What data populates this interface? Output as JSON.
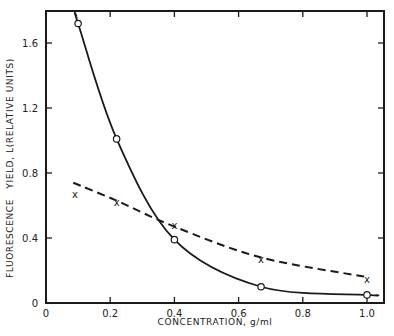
{
  "chart_data": {
    "type": "line",
    "title": "",
    "xlabel": "CONCENTRATION, g/ml",
    "ylabel": "FLUORESCENCE   YIELD, L(RELATIVE UNITS)",
    "xlim": [
      0,
      1.0
    ],
    "ylim": [
      0,
      1.8
    ],
    "x_ticks": [
      0,
      0.2,
      0.4,
      0.6,
      0.8,
      1.0
    ],
    "x_tick_labels": [
      "0",
      "0.2",
      "0.4",
      "0.6",
      "0.8",
      "1.0"
    ],
    "y_ticks": [
      0,
      0.4,
      0.8,
      1.2,
      1.6
    ],
    "y_tick_labels": [
      "0",
      "0.4",
      "0.8",
      "1.2",
      "1.6"
    ],
    "grid": false,
    "legend": null,
    "series": [
      {
        "name": "circles (solid curve)",
        "marker": "open-circle",
        "line_style": "solid",
        "x": [
          0.1,
          0.22,
          0.4,
          0.67,
          1.0
        ],
        "y": [
          1.72,
          1.01,
          0.39,
          0.1,
          0.05
        ]
      },
      {
        "name": "crosses (dashed curve)",
        "marker": "x",
        "line_style": "dashed",
        "x": [
          0.09,
          0.22,
          0.4,
          0.67,
          1.0
        ],
        "y": [
          0.67,
          0.62,
          0.48,
          0.27,
          0.15
        ]
      }
    ]
  },
  "colors": {
    "ink": "#1a1a1a",
    "background": "#ffffff"
  }
}
